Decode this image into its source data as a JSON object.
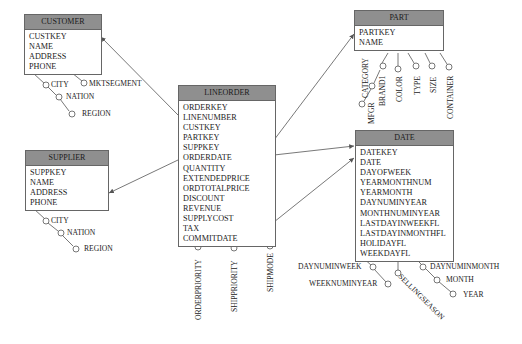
{
  "diagram": {
    "type": "star-schema",
    "entities": {
      "customer": {
        "title": "CUSTOMER",
        "attributes": [
          "CUSTKEY",
          "NAME",
          "ADDRESS",
          "PHONE"
        ],
        "hierarchy": [
          "CITY",
          "NATION",
          "REGION"
        ],
        "extra": [
          "MKTSEGMENT"
        ]
      },
      "supplier": {
        "title": "SUPPLIER",
        "attributes": [
          "SUPPKEY",
          "NAME",
          "ADDRESS",
          "PHONE"
        ],
        "hierarchy": [
          "CITY",
          "NATION",
          "REGION"
        ]
      },
      "lineorder": {
        "title": "LINEORDER",
        "attributes": [
          "ORDERKEY",
          "LINENUMBER",
          "CUSTKEY",
          "PARTKEY",
          "SUPPKEY",
          "ORDERDATE",
          "QUANTITY",
          "EXTENDEDPRICE",
          "ORDTOTALPRICE",
          "DISCOUNT",
          "REVENUE",
          "SUPPLYCOST",
          "TAX",
          "COMMITDATE"
        ],
        "degenerate": [
          "ORDERPRIORITY",
          "SHIPPRIORITY",
          "SHIPMODE"
        ]
      },
      "part": {
        "title": "PART",
        "attributes": [
          "PARTKEY",
          "NAME"
        ],
        "hierarchy": [
          "BRAND1",
          "CATEGORY",
          "MFGR"
        ],
        "extra": [
          "COLOR",
          "TYPE",
          "SIZE",
          "CONTAINER"
        ]
      },
      "date": {
        "title": "DATE",
        "attributes": [
          "DATEKEY",
          "DATE",
          "DAYOFWEEK",
          "YEARMONTHNUM",
          "YEARMONTH",
          "DAYNUMINYEAR",
          "MONTHNUMINYEAR",
          "LASTDAYINWEEKFL",
          "LASTDAYINMONTHFL",
          "HOLIDAYFL",
          "WEEKDAYFL"
        ],
        "left": [
          "DAYNUMINWEEK",
          "WEEKNUMINYEAR"
        ],
        "bottom": [
          "SELLINGSEASON"
        ],
        "hierarchy": [
          "DAYNUMINMONTH",
          "MONTH",
          "YEAR"
        ]
      }
    },
    "colors": {
      "header": "#8f8f8f",
      "border": "#666666",
      "line": "#555555"
    }
  }
}
